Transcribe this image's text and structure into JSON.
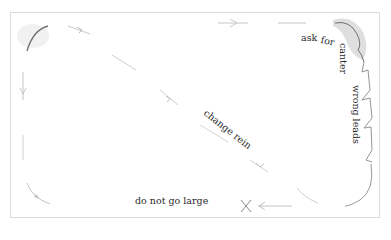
{
  "diagram": {
    "type": "riding-arena-path",
    "colors": {
      "border": "#d8d8d8",
      "path": "#b5b5b5",
      "path_dark": "#707070",
      "highlight": "#cfcfcf",
      "text": "#2a2a2a",
      "marker": "#8a8a8a"
    },
    "labels": {
      "ask": "ask",
      "for": "for",
      "canter": "canter",
      "wrong_leads": "wrong leads",
      "change_rein": "change rein",
      "do_not_go_large": "do not go large"
    },
    "markers": {
      "stop_point": "x-mark",
      "arrows": [
        "arrow-right-top",
        "arrow-left-bottom",
        "arrow-diagonal-up-left",
        "arrow-down-left-side"
      ]
    }
  }
}
